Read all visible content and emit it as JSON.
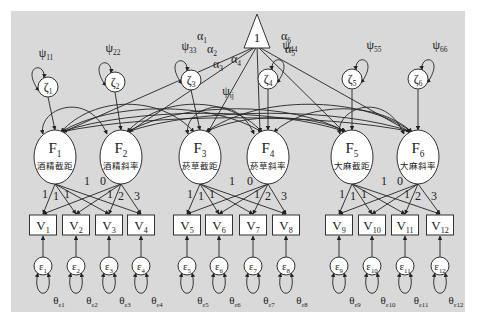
{
  "diagram": {
    "type": "structural-equation-model",
    "colors": {
      "background": "#d9d9d9",
      "node_fill": "#ffffff",
      "stroke": "#333333",
      "page": "#ffffff"
    },
    "constant": {
      "label": "1"
    },
    "intercepts": [
      "α1",
      "α2",
      "α3",
      "α4",
      "α5",
      "α6"
    ],
    "factor_covariance_label": "ψij",
    "disturbances": [
      {
        "id": "ζ1",
        "sym": "ζ",
        "sub": "1",
        "var_sym": "ψ",
        "var_sub": "11"
      },
      {
        "id": "ζ2",
        "sym": "ζ",
        "sub": "2",
        "var_sym": "ψ",
        "var_sub": "22"
      },
      {
        "id": "ζ3",
        "sym": "ζ",
        "sub": "3",
        "var_sym": "ψ",
        "var_sub": "33"
      },
      {
        "id": "ζ4",
        "sym": "ζ",
        "sub": "4",
        "var_sym": "ψ",
        "var_sub": "44"
      },
      {
        "id": "ζ5",
        "sym": "ζ",
        "sub": "5",
        "var_sym": "ψ",
        "var_sub": "55"
      },
      {
        "id": "ζ6",
        "sym": "ζ",
        "sub": "6",
        "var_sym": "ψ",
        "var_sub": "66"
      }
    ],
    "factors": [
      {
        "id": "F1",
        "sym": "F",
        "sub": "1",
        "name": "酒精截距"
      },
      {
        "id": "F2",
        "sym": "F",
        "sub": "2",
        "name": "酒精斜率"
      },
      {
        "id": "F3",
        "sym": "F",
        "sub": "3",
        "name": "菸草截距"
      },
      {
        "id": "F4",
        "sym": "F",
        "sub": "4",
        "name": "菸草斜率"
      },
      {
        "id": "F5",
        "sym": "F",
        "sub": "5",
        "name": "大麻截距"
      },
      {
        "id": "F6",
        "sym": "F",
        "sub": "6",
        "name": "大麻斜率"
      }
    ],
    "observed": [
      {
        "sym": "V",
        "sub": "1"
      },
      {
        "sym": "V",
        "sub": "2"
      },
      {
        "sym": "V",
        "sub": "3"
      },
      {
        "sym": "V",
        "sub": "4"
      },
      {
        "sym": "V",
        "sub": "5"
      },
      {
        "sym": "V",
        "sub": "6"
      },
      {
        "sym": "V",
        "sub": "7"
      },
      {
        "sym": "V",
        "sub": "8"
      },
      {
        "sym": "V",
        "sub": "9"
      },
      {
        "sym": "V",
        "sub": "10"
      },
      {
        "sym": "V",
        "sub": "11"
      },
      {
        "sym": "V",
        "sub": "12"
      }
    ],
    "errors": [
      {
        "sym": "ε",
        "sub": "1",
        "theta": "θ",
        "theta_sub": "ε1"
      },
      {
        "sym": "ε",
        "sub": "2",
        "theta": "θ",
        "theta_sub": "ε2"
      },
      {
        "sym": "ε",
        "sub": "3",
        "theta": "θ",
        "theta_sub": "ε3"
      },
      {
        "sym": "ε",
        "sub": "4",
        "theta": "θ",
        "theta_sub": "ε4"
      },
      {
        "sym": "ε",
        "sub": "5",
        "theta": "θ",
        "theta_sub": "ε5"
      },
      {
        "sym": "ε",
        "sub": "6",
        "theta": "θ",
        "theta_sub": "ε6"
      },
      {
        "sym": "ε",
        "sub": "7",
        "theta": "θ",
        "theta_sub": "ε7"
      },
      {
        "sym": "ε",
        "sub": "8",
        "theta": "θ",
        "theta_sub": "ε8"
      },
      {
        "sym": "ε",
        "sub": "9",
        "theta": "θ",
        "theta_sub": "ε9"
      },
      {
        "sym": "ε",
        "sub": "10",
        "theta": "θ",
        "theta_sub": "ε10"
      },
      {
        "sym": "ε",
        "sub": "11",
        "theta": "θ",
        "theta_sub": "ε11"
      },
      {
        "sym": "ε",
        "sub": "12",
        "theta": "θ",
        "theta_sub": "ε12"
      }
    ],
    "loadings": {
      "intercept": [
        "1",
        "1",
        "1",
        "1"
      ],
      "slope": [
        "0",
        "1",
        "2",
        "3"
      ]
    }
  }
}
